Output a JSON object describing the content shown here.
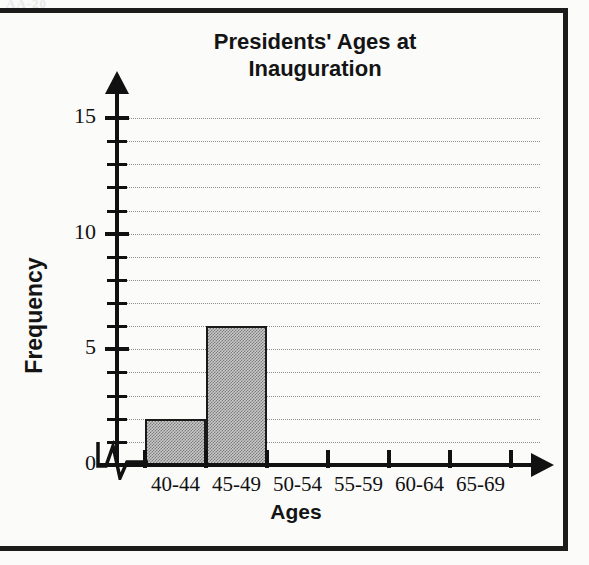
{
  "page": {
    "corner_artifact_text": "AA-20",
    "background_color": "#fbfbfa",
    "frame_color": "#1c1c1c"
  },
  "chart_data": {
    "type": "bar",
    "title": "Presidents' Ages at Inauguration",
    "title_line1": "Presidents' Ages at",
    "title_line2": "Inauguration",
    "xlabel": "Ages",
    "ylabel": "Frequency",
    "categories": [
      "40-44",
      "45-49",
      "50-54",
      "55-59",
      "60-64",
      "65-69"
    ],
    "values": [
      2,
      6,
      0,
      0,
      0,
      0
    ],
    "ylim": [
      0,
      15
    ],
    "ytick_major": [
      0,
      5,
      10,
      15
    ],
    "ytick_major_labels": [
      "0",
      "5",
      "10",
      "15"
    ],
    "ytick_minor_step": 1,
    "grid": true,
    "grid_style": "dotted",
    "legend": "none",
    "x_axis_break": true,
    "bar_fill_color": "#999999",
    "bar_edge_color": "#1a1a1a",
    "axis_color": "#111111",
    "grid_color": "#8d8d8d"
  }
}
